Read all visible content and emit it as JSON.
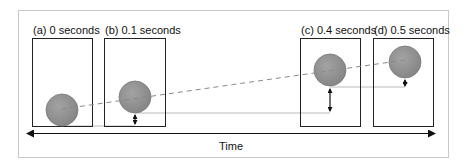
{
  "diagram": {
    "frames": [
      {
        "id": "a",
        "label": "(a) 0 seconds",
        "x": 32,
        "ball_cx": 62,
        "ball_cy": 110
      },
      {
        "id": "b",
        "label": "(b) 0.1 seconds",
        "x": 104,
        "ball_cx": 135,
        "ball_cy": 97
      },
      {
        "id": "c",
        "label": "(c) 0.4 seconds",
        "x": 300,
        "ball_cx": 330,
        "ball_cy": 70
      },
      {
        "id": "d",
        "label": "(d) 0.5 seconds",
        "x": 373,
        "ball_cx": 405,
        "ball_cy": 62
      }
    ],
    "axis_label": "Time",
    "colors": {
      "ball": "#8f8f8f",
      "ball_edge": "#777777",
      "frame_border": "#222222",
      "outer_border": "#c8c8c8",
      "dashed_line": "#999999",
      "guide_line": "#aaaaaa"
    }
  }
}
